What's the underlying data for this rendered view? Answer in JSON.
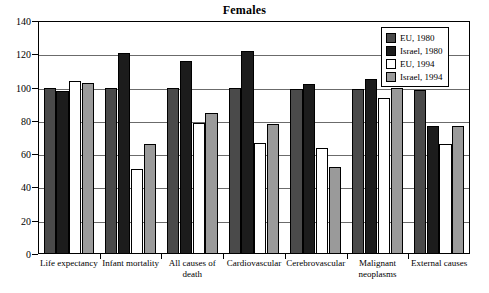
{
  "chart_data": {
    "type": "bar",
    "title": "Females",
    "xlabel": "",
    "ylabel": "",
    "ylim": [
      0,
      140
    ],
    "ytick_step": 20,
    "yticks": [
      0,
      20,
      40,
      60,
      80,
      100,
      120,
      140
    ],
    "grid": true,
    "legend_position": "top-right",
    "categories": [
      "Life expectancy",
      "Infant mortality",
      "All causes of death",
      "Cardiovascular",
      "Cerebrovascular",
      "Malignant neoplasms",
      "External causes"
    ],
    "series": [
      {
        "name": "EU, 1980",
        "color": "#4a4a4a",
        "values": [
          100,
          100,
          100,
          100,
          99,
          99,
          98.5
        ]
      },
      {
        "name": "Israel, 1980",
        "color": "#1c1c1c",
        "values": [
          98,
          121,
          116,
          122,
          102,
          105,
          77
        ]
      },
      {
        "name": "EU, 1994",
        "color": "#ffffff",
        "values": [
          104,
          51,
          79,
          67,
          64,
          94,
          66
        ]
      },
      {
        "name": "Israel, 1994",
        "color": "#9a9a9a",
        "values": [
          102.5,
          66,
          85,
          78,
          52,
          99.5,
          77
        ]
      }
    ]
  },
  "legend": {
    "items": [
      {
        "label": "EU, 1980"
      },
      {
        "label": "Israel, 1980"
      },
      {
        "label": "EU, 1994"
      },
      {
        "label": "Israel, 1994"
      }
    ]
  },
  "x_labels": [
    {
      "line1": "Life expectancy",
      "line2": ""
    },
    {
      "line1": "Infant mortality",
      "line2": ""
    },
    {
      "line1": "All causes of",
      "line2": "death"
    },
    {
      "line1": "Cardiovascular",
      "line2": ""
    },
    {
      "line1": "Cerebrovascular",
      "line2": ""
    },
    {
      "line1": "Malignant",
      "line2": "neoplasms"
    },
    {
      "line1": "External causes",
      "line2": ""
    }
  ]
}
